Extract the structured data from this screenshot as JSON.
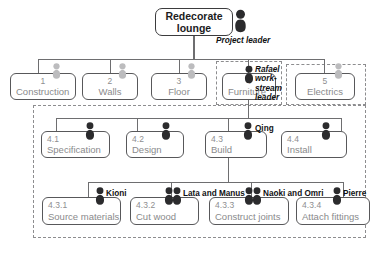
{
  "diagram": {
    "type": "work-breakdown-structure",
    "root": {
      "title": "Redecorate lounge"
    },
    "project_leader": {
      "role_label": "Project leader",
      "icon": "person-icon-dark",
      "people_count": 1
    },
    "level1": [
      {
        "num": "1",
        "name": "Construction",
        "icon": "person-icon-light",
        "people_count": 1
      },
      {
        "num": "2",
        "name": "Walls",
        "icon": "person-icon-light",
        "people_count": 1
      },
      {
        "num": "3",
        "name": "Floor",
        "icon": "person-icon-light",
        "people_count": 1
      },
      {
        "num": "4",
        "name": "Furniture",
        "icon": "person-icon-dark",
        "people_count": 1,
        "role_label": "Rafael work-stream leader"
      },
      {
        "num": "5",
        "name": "Electrics",
        "icon": "person-icon-light",
        "people_count": 1
      }
    ],
    "level2": [
      {
        "num": "4.1",
        "name": "Specification",
        "icon": "person-icon-dark",
        "people_count": 1,
        "assignee": ""
      },
      {
        "num": "4.2",
        "name": "Design",
        "icon": "person-icon-dark",
        "people_count": 1,
        "assignee": ""
      },
      {
        "num": "4.3",
        "name": "Build",
        "icon": "person-icon-dark",
        "people_count": 1,
        "assignee": "Qing"
      },
      {
        "num": "4.4",
        "name": "Install",
        "icon": "person-icon-dark",
        "people_count": 1,
        "assignee": ""
      }
    ],
    "level3": [
      {
        "num": "4.3.1",
        "name": "Source materials",
        "icon": "person-icon-dark",
        "people_count": 1,
        "assignee": "Kioni"
      },
      {
        "num": "4.3.2",
        "name": "Cut wood",
        "icon": "person-icon-dark",
        "people_count": 2,
        "assignee": "Lata and Manus"
      },
      {
        "num": "4.3.3",
        "name": "Construct joints",
        "icon": "person-icon-dark",
        "people_count": 2,
        "assignee": "Naoki and Omri"
      },
      {
        "num": "4.3.4",
        "name": "Attach fittings",
        "icon": "person-icon-dark",
        "people_count": 1,
        "assignee": "Pierre"
      }
    ],
    "groups": [
      {
        "id": "furniture-workstream-group",
        "label": ""
      },
      {
        "id": "electrics-workstream-group",
        "label": ""
      },
      {
        "id": "furniture-breakdown-group",
        "label": ""
      }
    ],
    "colors": {
      "box_border": "#58585a",
      "box_text": "#8a8a8c",
      "root_text": "#1c1c1e",
      "connector": "#6e6e70",
      "dashed_group": "#8d8d8f",
      "person_dark": "#2b2b2d",
      "person_light": "#bcbcbe",
      "background": "#ffffff"
    }
  }
}
